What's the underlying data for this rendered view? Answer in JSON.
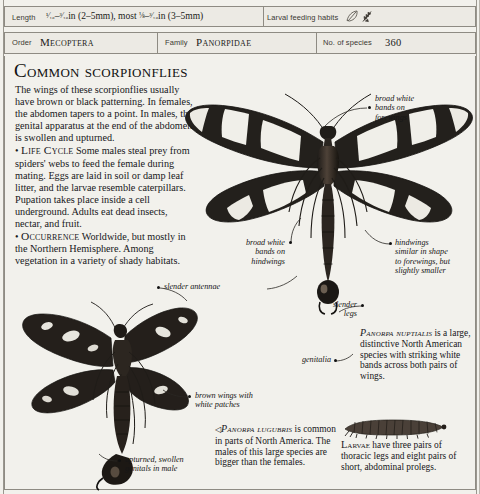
{
  "header": {
    "length": {
      "label": "Length",
      "value": "1/16–3/16in (2–5mm), most 1/8–3/16in (3–5mm)",
      "value_plain": "⅟₁₆–³⁄₁₆in (2–5mm), most ⅛–³⁄₁₆in (3–5mm)"
    },
    "larval_feeding": {
      "label": "Larval feeding habits",
      "icons": [
        "leaf-icon",
        "feather-icon"
      ]
    },
    "order": {
      "label": "Order",
      "value": "Mecoptera"
    },
    "family": {
      "label": "Family",
      "value": "Panorpidae"
    },
    "species_count": {
      "label": "No. of species",
      "value": "360"
    }
  },
  "main": {
    "title": "Common scorpionflies",
    "intro": "The wings of these scorpionflies usually have brown or black patterning. In females, the abdomen tapers to a point. In males, the genital apparatus at the end of the abdomen is swollen and upturned.",
    "life_cycle": {
      "heading": "Life Cycle",
      "text": "Some males steal prey from spiders' webs to feed the female during mating. Eggs are laid in soil or damp leaf litter, and the larvae resemble caterpillars. Pupation takes place inside a cell underground. Adults eat dead insects, nectar, and fruit."
    },
    "occurrence": {
      "heading": "Occurrence",
      "text": "Worldwide, but mostly in the Northern Hemisphere. Among vegetation in a variety of shady habitats."
    }
  },
  "annotations": [
    {
      "id": "broad-white-bands-forewings",
      "lines": [
        "broad white",
        "bands on",
        "forewings"
      ]
    },
    {
      "id": "broad-white-bands-hindwings",
      "lines": [
        "broad white",
        "bands on",
        "hindwings"
      ]
    },
    {
      "id": "hindwings-similar",
      "lines": [
        "hindwings",
        "similar in shape",
        "to forewings, but",
        "slightly smaller"
      ]
    },
    {
      "id": "slender-antennae",
      "lines": [
        "slender antennae"
      ]
    },
    {
      "id": "slender-legs",
      "lines": [
        "slender",
        "legs"
      ]
    },
    {
      "id": "genitalia",
      "lines": [
        "genitalia"
      ]
    },
    {
      "id": "brown-wings",
      "lines": [
        "brown wings with",
        "white patches"
      ]
    },
    {
      "id": "upturned-genitals",
      "lines": [
        "upturned, swollen",
        "genitals in male"
      ]
    }
  ],
  "captions": {
    "nuptialis": {
      "species": "Panorpa nuptialis",
      "text": "is a large, distinctive North American species with striking white bands across both pairs of wings."
    },
    "lugubris": {
      "marker": "◁",
      "species": "Panorpa lugubris",
      "text": "is common in parts of North America. The males of this large species are bigger than the females."
    },
    "larvae": {
      "heading": "Larvae",
      "text": "have three pairs of thoracic legs and eight pairs of short, abdominal prolegs."
    }
  },
  "figures": [
    {
      "id": "panorpa-nuptialis-specimen",
      "name": "scorpionfly-specimen-large"
    },
    {
      "id": "panorpa-lugubris-specimen",
      "name": "scorpionfly-specimen-dark"
    },
    {
      "id": "larva-specimen",
      "name": "caterpillar-larva"
    }
  ],
  "colors": {
    "page_bg": "#f2f1ec",
    "rule": "#8e8b83",
    "ink": "#17171a",
    "wing_dark": "#2b2723",
    "wing_light": "#efeee8",
    "body_brown": "#3a2f26"
  }
}
